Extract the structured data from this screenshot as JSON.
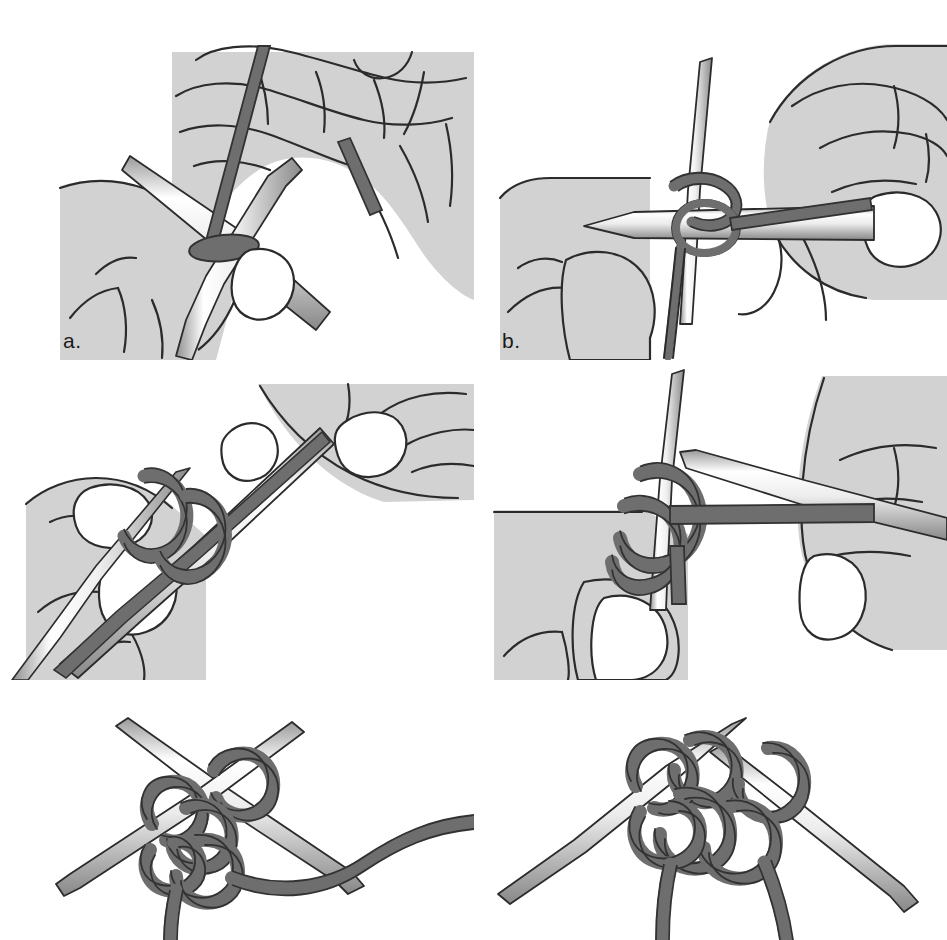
{
  "figure": {
    "background_color": "#ffffff",
    "panel_count": 6,
    "layout": "2 columns x 3 rows"
  },
  "palette": {
    "skin_fill": "#d2d2d2",
    "skin_outline": "#2b2b2b",
    "nail_fill": "#ffffff",
    "yarn_fill": "#6e6e6e",
    "yarn_outline": "#323232",
    "needle_light": "#ffffff",
    "needle_mid": "#d6d6d6",
    "needle_dark": "#8a8a8a",
    "needle_outline": "#2b2b2b",
    "label_color": "#1a1a1a"
  },
  "panels": [
    {
      "id": "a",
      "label": "a.",
      "caption_letter": "a",
      "row": 1,
      "column": 1,
      "description": "Two needles held together pointing up-left through a yarn loop, right hand fingers above holding the working yarn strand, left thumb below supporting needles",
      "elements": [
        "hand-upper",
        "hand-lower",
        "needle-upper-left",
        "needle-lower",
        "yarn-strand-vertical",
        "yarn-loop",
        "thumbnail"
      ]
    },
    {
      "id": "b",
      "label": "b.",
      "caption_letter": "b",
      "row": 1,
      "column": 2,
      "description": "Vertical needle with yarn loop, horizontal needle inserted through loop from the right, right hand pinching yarn with thumb and index finger",
      "elements": [
        "hand-left",
        "hand-right",
        "needle-vertical",
        "needle-horizontal",
        "yarn-loop",
        "yarn-strand-horizontal",
        "thumbnail"
      ]
    },
    {
      "id": "c",
      "label": "c.",
      "caption_letter": "c",
      "row": 2,
      "column": 1,
      "description": "Diagonal needle running lower-left to upper-right with two yarn wraps around it, held between thumb and fingers of both hands",
      "elements": [
        "hand-left",
        "hand-right",
        "needle-diagonal",
        "needle-second",
        "yarn-wrap-1",
        "yarn-wrap-2",
        "thumbnail"
      ]
    },
    {
      "id": "d",
      "label": "d.",
      "caption_letter": "d",
      "row": 2,
      "column": 2,
      "description": "Vertical needle with yarn crossing over it, second needle entering from upper right, right hand drawing the yarn across",
      "elements": [
        "hand-left",
        "hand-right",
        "needle-vertical",
        "needle-diagonal",
        "yarn-cross",
        "yarn-strand-horizontal",
        "thumbnail"
      ]
    },
    {
      "id": "e",
      "label": "e.",
      "caption_letter": "e",
      "row": 3,
      "column": 1,
      "description": "Two crossed needles with a loose slip knot of yarn formed around them, working yarn exiting to the right",
      "elements": [
        "needle-left-down",
        "needle-right-down",
        "yarn-knot",
        "yarn-tail-right"
      ]
    },
    {
      "id": "f",
      "label": "f.",
      "caption_letter": "f",
      "row": 3,
      "column": 2,
      "description": "Two crossed needle tips with the completed cast-on stitch tightened, two yarn ends hanging down",
      "elements": [
        "needle-left-down",
        "needle-right-down",
        "yarn-stitch",
        "yarn-tail-a",
        "yarn-tail-b"
      ]
    }
  ]
}
